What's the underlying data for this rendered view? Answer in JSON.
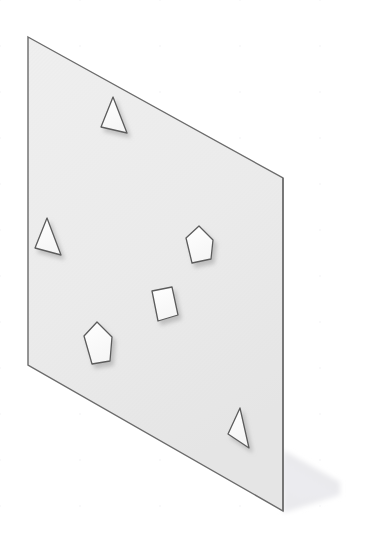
{
  "app": {
    "view_type": "3d-isometric-viewport",
    "background_color": "#ffffff",
    "grid_color": "#f0f0f2",
    "grid_spacing_px": 46,
    "canvas_width": 365,
    "canvas_height": 549
  },
  "ground_grid": {
    "name": "isometric-floor-grid",
    "line_color": "#f1f1f3",
    "line_width": 1.2,
    "slope_up_deg": -30,
    "slope_down_deg": 30
  },
  "plane": {
    "name": "sketch-plane",
    "fill_color": "#ebebeb",
    "fill_color_top": "#eeeeee",
    "fill_color_bottom": "#e6e6e6",
    "edge_color": "#6b6b6b",
    "edge_width": 1.4,
    "corners": [
      {
        "label": "top-left",
        "x": 28,
        "y": 37
      },
      {
        "label": "top-right",
        "x": 283,
        "y": 178
      },
      {
        "label": "bottom-right",
        "x": 283,
        "y": 511
      },
      {
        "label": "bottom-left",
        "x": 28,
        "y": 365
      }
    ],
    "shadow": {
      "name": "plane-ground-shadow",
      "color": "#e9e9ec",
      "opacity": 0.75,
      "points": "283,511 283,455 340,487 340,489"
    }
  },
  "cutouts": [
    {
      "id": "triangle-top",
      "shape": "triangle",
      "label": "Triangle",
      "fill": "#fdfdfd",
      "stroke": "#5c5c5c",
      "points": "113,97 101,127 127,133"
    },
    {
      "id": "triangle-left",
      "shape": "triangle",
      "label": "Triangle",
      "fill": "#fdfdfd",
      "stroke": "#5c5c5c",
      "points": "47,218 35,248 61,255"
    },
    {
      "id": "pentagon-right",
      "shape": "pentagon",
      "label": "Pentagon",
      "fill": "#fdfdfd",
      "stroke": "#5c5c5c",
      "points": "199,226 213,240 211,259 192,263 186,238"
    },
    {
      "id": "quad-center",
      "shape": "quadrilateral",
      "label": "Quadrilateral",
      "fill": "#fdfdfd",
      "stroke": "#5c5c5c",
      "points": "152,291 172,287 178,315 158,321"
    },
    {
      "id": "pentagon-lower-left",
      "shape": "pentagon",
      "label": "Pentagon",
      "fill": "#fdfdfd",
      "stroke": "#5c5c5c",
      "points": "97,322 112,337 110,361 92,364 84,336"
    },
    {
      "id": "triangle-bottom-right",
      "shape": "triangle",
      "label": "Triangle",
      "fill": "#fdfdfd",
      "stroke": "#5c5c5c",
      "points": "240,408 228,434 249,448"
    }
  ],
  "shape_shadow": {
    "name": "cutout-drop-shadow",
    "color": "#a8a8a8",
    "blur_px": 2.2,
    "offset_x": 3,
    "offset_y": 4,
    "opacity": 0.55
  }
}
